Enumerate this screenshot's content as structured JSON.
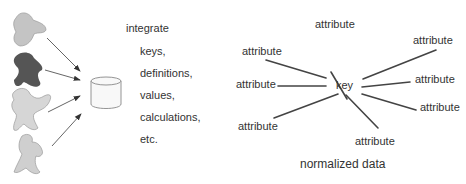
{
  "left": {
    "sources": [
      {
        "name": "source-blob-1",
        "fill": "#c4c4c4"
      },
      {
        "name": "source-blob-2",
        "fill": "#555555"
      },
      {
        "name": "source-blob-3",
        "fill": "#d6d6d6"
      },
      {
        "name": "source-blob-4",
        "fill": "#cfcfcf"
      }
    ],
    "database_icon": "database-icon",
    "heading": "integrate",
    "items": [
      "keys,",
      "definitions,",
      "values,",
      "calculations,",
      "etc."
    ]
  },
  "right": {
    "center": "key",
    "attributes": [
      "attribute",
      "attribute",
      "attribute",
      "attribute",
      "attribute",
      "attribute",
      "attribute",
      "attribute"
    ],
    "caption": "normalized data"
  },
  "colors": {
    "line": "#444444",
    "text": "#333333"
  }
}
